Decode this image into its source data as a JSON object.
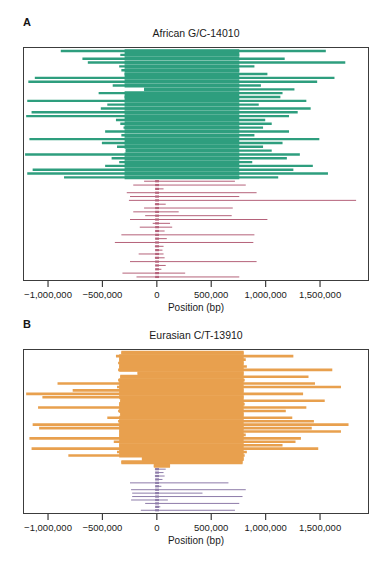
{
  "figure": {
    "background": "#ffffff",
    "x_axis": {
      "label": "Position (bp)",
      "tick_labels": [
        "−1,000,000",
        "−500,000",
        "0",
        "500,000",
        "1,000,000",
        "1,500,000"
      ],
      "tick_values": [
        -1000000,
        -500000,
        0,
        500000,
        1000000,
        1500000
      ],
      "xlim": [
        -1230000,
        1950000
      ]
    }
  },
  "panels": [
    {
      "key": "A",
      "label": "A",
      "title": "African G/C-14010",
      "colors": {
        "derived": "#2e9e7e",
        "ancestral": "#b5627a"
      }
    },
    {
      "key": "B",
      "label": "B",
      "title": "Eurasian C/T-13910",
      "colors": {
        "derived": "#e8a04e",
        "ancestral": "#8d7ba9"
      }
    }
  ],
  "chart_data": [
    {
      "type": "bar",
      "title": "African G/C-14010",
      "xlabel": "Position (bp)",
      "ylabel": "",
      "xlim": [
        -1230000,
        1950000
      ],
      "grid": false,
      "legend": "none",
      "orientation": "horizontal-segments",
      "description": "Haplotype homozygosity tract lengths per chromosome, centered on the G/C-14010 variant at position 0. Upper series = selected (derived) haplotypes in green, lower series = ancestral haplotypes in rose.",
      "series": [
        {
          "name": "derived-haplotypes",
          "color": "#2e9e7e",
          "segments": [
            [
              -890000,
              1560000
            ],
            [
              -340000,
              760000
            ],
            [
              -690000,
              1180000
            ],
            [
              -640000,
              1740000
            ],
            [
              -350000,
              900000
            ],
            [
              -330000,
              760000
            ],
            [
              -300000,
              1020000
            ],
            [
              -1130000,
              1640000
            ],
            [
              -1190000,
              1480000
            ],
            [
              -410000,
              960000
            ],
            [
              -120000,
              1270000
            ],
            [
              -540000,
              1160000
            ],
            [
              -300000,
              1140000
            ],
            [
              -1200000,
              1380000
            ],
            [
              -460000,
              940000
            ],
            [
              -520000,
              1420000
            ],
            [
              -1160000,
              1300000
            ],
            [
              -1210000,
              1220000
            ],
            [
              -380000,
              1000000
            ],
            [
              -340000,
              1060000
            ],
            [
              -310000,
              980000
            ],
            [
              -480000,
              1220000
            ],
            [
              -330000,
              900000
            ],
            [
              -1180000,
              1500000
            ],
            [
              -510000,
              1160000
            ],
            [
              -370000,
              980000
            ],
            [
              -290000,
              1060000
            ],
            [
              -1220000,
              1320000
            ],
            [
              -420000,
              1200000
            ],
            [
              -350000,
              880000
            ],
            [
              -480000,
              1440000
            ],
            [
              -1150000,
              1260000
            ],
            [
              -1200000,
              1580000
            ],
            [
              -860000,
              1120000
            ]
          ]
        },
        {
          "name": "ancestral-haplotypes",
          "color": "#b5627a",
          "segments": [
            [
              -120000,
              720000
            ],
            [
              -220000,
              820000
            ],
            [
              -10000,
              60000
            ],
            [
              -280000,
              920000
            ],
            [
              -250000,
              760000
            ],
            [
              -260000,
              1840000
            ],
            [
              -20000,
              80000
            ],
            [
              -120000,
              700000
            ],
            [
              -220000,
              200000
            ],
            [
              -110000,
              690000
            ],
            [
              -250000,
              1020000
            ],
            [
              -40000,
              120000
            ],
            [
              -160000,
              140000
            ],
            [
              -10000,
              70000
            ],
            [
              -330000,
              900000
            ],
            [
              -10000,
              90000
            ],
            [
              -390000,
              890000
            ],
            [
              -20000,
              60000
            ],
            [
              -10000,
              50000
            ],
            [
              -170000,
              60000
            ],
            [
              -20000,
              70000
            ],
            [
              -250000,
              920000
            ],
            [
              -10000,
              80000
            ],
            [
              -10000,
              40000
            ],
            [
              -320000,
              260000
            ],
            [
              -190000,
              760000
            ]
          ]
        }
      ]
    },
    {
      "type": "bar",
      "title": "Eurasian C/T-13910",
      "xlabel": "Position (bp)",
      "ylabel": "",
      "xlim": [
        -1230000,
        1950000
      ],
      "grid": false,
      "legend": "none",
      "orientation": "horizontal-segments",
      "description": "Haplotype homozygosity tract lengths per chromosome, centered on the C/T-13910 variant at position 0. Upper series = selected (derived) haplotypes in orange, lower series = ancestral haplotypes in purple.",
      "series": [
        {
          "name": "derived-haplotypes",
          "color": "#e8a04e",
          "segments": [
            [
              -330000,
              800000
            ],
            [
              -380000,
              1260000
            ],
            [
              -350000,
              820000
            ],
            [
              -360000,
              800000
            ],
            [
              -350000,
              830000
            ],
            [
              -360000,
              1620000
            ],
            [
              -180000,
              800000
            ],
            [
              -340000,
              1400000
            ],
            [
              -360000,
              810000
            ],
            [
              -920000,
              1460000
            ],
            [
              -370000,
              1700000
            ],
            [
              -780000,
              800000
            ],
            [
              -1210000,
              1350000
            ],
            [
              -1060000,
              800000
            ],
            [
              -340000,
              1550000
            ],
            [
              -350000,
              810000
            ],
            [
              -1100000,
              1380000
            ],
            [
              -360000,
              1190000
            ],
            [
              -340000,
              800000
            ],
            [
              -460000,
              1250000
            ],
            [
              -360000,
              1450000
            ],
            [
              -1150000,
              1770000
            ],
            [
              -1090000,
              1430000
            ],
            [
              -350000,
              1700000
            ],
            [
              -350000,
              820000
            ],
            [
              -1180000,
              1330000
            ],
            [
              -400000,
              1280000
            ],
            [
              -350000,
              1160000
            ],
            [
              -1160000,
              1490000
            ],
            [
              -370000,
              830000
            ],
            [
              -820000,
              810000
            ],
            [
              -140000,
              800000
            ],
            [
              -330000,
              790000
            ],
            [
              -30000,
              120000
            ]
          ]
        },
        {
          "name": "ancestral-haplotypes",
          "color": "#8d7ba9",
          "segments": [
            [
              -20000,
              80000
            ],
            [
              -10000,
              60000
            ],
            [
              -20000,
              70000
            ],
            [
              -10000,
              50000
            ],
            [
              -250000,
              660000
            ],
            [
              -10000,
              40000
            ],
            [
              -240000,
              820000
            ],
            [
              -230000,
              420000
            ],
            [
              -230000,
              790000
            ],
            [
              -240000,
              100000
            ],
            [
              -110000,
              760000
            ],
            [
              -10000,
              30000
            ],
            [
              -150000,
              720000
            ]
          ]
        }
      ]
    }
  ]
}
